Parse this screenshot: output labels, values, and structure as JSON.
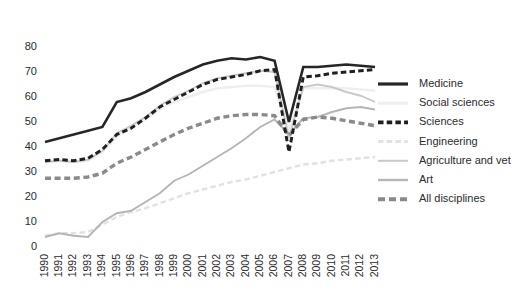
{
  "chart_data": {
    "type": "line",
    "title": "",
    "subtitle": "",
    "xlabel": "",
    "ylabel": "",
    "grid": false,
    "legend_position": "right",
    "xlim": [
      1990,
      2013
    ],
    "ylim": [
      0,
      80
    ],
    "ytick_labels": [
      "0",
      "10",
      "20",
      "30",
      "40",
      "50",
      "60",
      "70",
      "80"
    ],
    "ytick_values": [
      0,
      10,
      20,
      30,
      40,
      50,
      60,
      70,
      80
    ],
    "x": [
      1990,
      1991,
      1992,
      1993,
      1994,
      1995,
      1996,
      1997,
      1998,
      1999,
      2000,
      2001,
      2002,
      2003,
      2004,
      2005,
      2006,
      2007,
      2008,
      2009,
      2010,
      2011,
      2012,
      2013
    ],
    "categories": [
      "1990",
      "1991",
      "1992",
      "1993",
      "1994",
      "1995",
      "1996",
      "1997",
      "1998",
      "1999",
      "2000",
      "2001",
      "2002",
      "2003",
      "2004",
      "2005",
      "2006",
      "2007",
      "2008",
      "2009",
      "2010",
      "2011",
      "2012",
      "2013"
    ],
    "series": [
      {
        "name": "Medicine",
        "color": "#262626",
        "width": 2.6,
        "dash": "none",
        "values": [
          42,
          43.5,
          45,
          46.5,
          48,
          58,
          59.5,
          62,
          65,
          68,
          70.5,
          73,
          74.5,
          75.5,
          75,
          76,
          74.5,
          50,
          72,
          72,
          72.5,
          73,
          72.5,
          72
        ]
      },
      {
        "name": "Social sciences",
        "color": "#efefef",
        "width": 2.4,
        "dash": "none",
        "values": [
          34,
          34.5,
          34,
          34.5,
          38,
          44,
          48,
          51,
          55,
          58,
          60,
          62,
          63.5,
          64,
          64.5,
          64.5,
          64,
          47,
          63.5,
          63.5,
          63.5,
          63.5,
          63,
          62.5
        ]
      },
      {
        "name": "Sciences",
        "color": "#1f1f1f",
        "width": 2.9,
        "dash": "5.5,3.2",
        "values": [
          34.5,
          35,
          34.5,
          35.5,
          39,
          45,
          47.5,
          51.5,
          56,
          59,
          62,
          65,
          67,
          68,
          69,
          70.5,
          71,
          38,
          68,
          68.5,
          69.5,
          70,
          70.5,
          71
        ]
      },
      {
        "name": "Engineering",
        "color": "#e2e2e2",
        "width": 2.4,
        "dash": "5.5,3.2",
        "values": [
          4.5,
          5.5,
          5.5,
          6,
          9,
          12,
          14,
          15.5,
          17.5,
          19.5,
          21.5,
          23,
          24.5,
          26,
          27,
          28.5,
          30,
          31.5,
          33,
          33.5,
          34.5,
          35,
          35.5,
          36
        ]
      },
      {
        "name": "Agriculture and vet",
        "color": "#c9c9c9",
        "width": 1.9,
        "dash": "none",
        "values": [
          34,
          34.5,
          34,
          35,
          38.5,
          45.5,
          48.5,
          52,
          56.5,
          60,
          62.5,
          65.5,
          67.5,
          68.5,
          69.5,
          70.5,
          70,
          43.5,
          64,
          65,
          64,
          62,
          60.5,
          58
        ]
      },
      {
        "name": "Art",
        "color": "#b5b5b5",
        "width": 1.9,
        "dash": "none",
        "values": [
          4,
          5.5,
          4.5,
          4,
          10,
          13.5,
          14.5,
          18,
          21.5,
          26.5,
          29,
          32.5,
          36,
          39.5,
          43.5,
          48,
          51,
          45,
          51.5,
          52,
          54,
          55.5,
          56,
          55
        ]
      },
      {
        "name": "All disciplines",
        "color": "#8a8a8a",
        "width": 3.4,
        "dash": "6,3.6",
        "values": [
          27.5,
          27.5,
          27.5,
          28,
          29.5,
          33.5,
          36,
          39,
          42,
          45,
          47.5,
          49.5,
          51.5,
          52.5,
          53,
          53,
          52.5,
          44.5,
          51,
          52,
          51.5,
          50.5,
          49.5,
          48.5
        ]
      }
    ],
    "legend_entries": [
      {
        "label": "Medicine",
        "color": "#262626",
        "dash": "none",
        "width": 3.2
      },
      {
        "label": "Social sciences",
        "color": "#efefef",
        "dash": "none",
        "width": 3.0
      },
      {
        "label": "Sciences",
        "color": "#1f1f1f",
        "dash": "5.5,3.2",
        "width": 3.6
      },
      {
        "label": "Engineering",
        "color": "#e2e2e2",
        "dash": "5.5,3.2",
        "width": 3.0
      },
      {
        "label": "Agriculture and vet",
        "color": "#c9c9c9",
        "dash": "none",
        "width": 2.0
      },
      {
        "label": "Art",
        "color": "#b5b5b5",
        "dash": "none",
        "width": 2.4
      },
      {
        "label": "All disciplines",
        "color": "#8a8a8a",
        "dash": "7,4",
        "width": 4.0
      }
    ]
  }
}
